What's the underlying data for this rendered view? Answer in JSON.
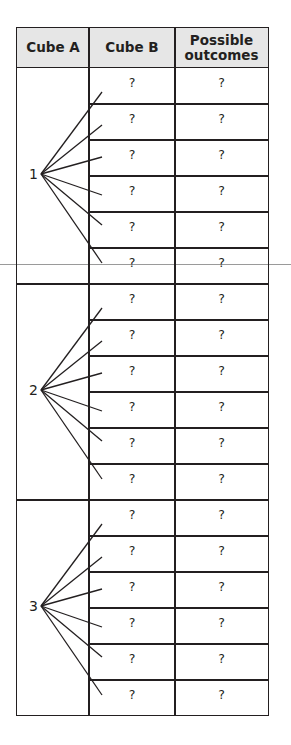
{
  "header": {
    "clipped_text": "...by comparing the..."
  },
  "table": {
    "columns": [
      "Cube A",
      "Cube B",
      "Possible outcomes"
    ],
    "groups": [
      {
        "cube_a": "1",
        "rows": [
          [
            "?",
            "?"
          ],
          [
            "?",
            "?"
          ],
          [
            "?",
            "?"
          ],
          [
            "?",
            "?"
          ],
          [
            "?",
            "?"
          ],
          [
            "?",
            "?"
          ]
        ]
      },
      {
        "cube_a": "2",
        "rows": [
          [
            "?",
            "?"
          ],
          [
            "?",
            "?"
          ],
          [
            "?",
            "?"
          ],
          [
            "?",
            "?"
          ],
          [
            "?",
            "?"
          ],
          [
            "?",
            "?"
          ]
        ]
      },
      {
        "cube_a": "3",
        "rows": [
          [
            "?",
            "?"
          ],
          [
            "?",
            "?"
          ],
          [
            "?",
            "?"
          ],
          [
            "?",
            "?"
          ],
          [
            "?",
            "?"
          ],
          [
            "?",
            "?"
          ]
        ]
      }
    ]
  },
  "colors": {
    "header_bg": "#e6e6e6",
    "line": "#231f20"
  }
}
